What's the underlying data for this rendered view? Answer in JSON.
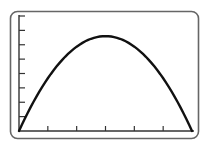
{
  "chart_data": {
    "type": "line",
    "title": "",
    "xlabel": "",
    "ylabel": "",
    "x_ticks": 6,
    "y_ticks": 8,
    "xlim": [
      0,
      6
    ],
    "ylim": [
      0,
      8
    ],
    "grid": false,
    "legend": null,
    "series": [
      {
        "name": "curve",
        "x": [
          0,
          0.5,
          1,
          1.5,
          2,
          2.5,
          3,
          3.5,
          4,
          4.5,
          5,
          5.5,
          6
        ],
        "y": [
          0,
          1.85,
          3.4,
          4.65,
          5.6,
          6.25,
          6.6,
          6.25,
          5.6,
          4.65,
          3.4,
          1.85,
          0
        ]
      }
    ]
  },
  "frame": {
    "stroke_color": "#555555",
    "curve_color": "#111111",
    "axis_color": "#333333"
  }
}
